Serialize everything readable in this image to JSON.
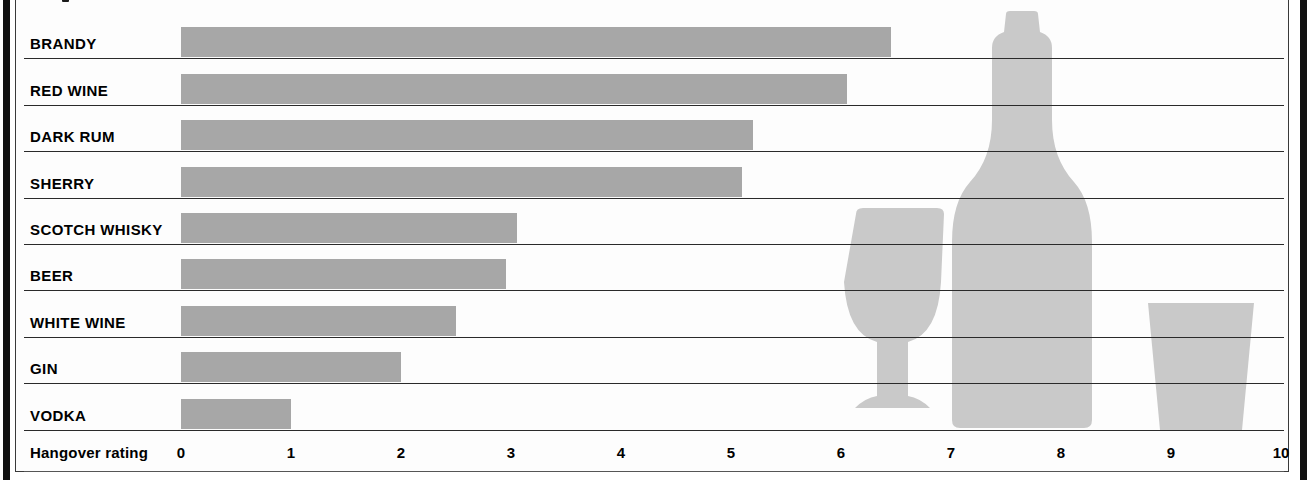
{
  "chart_data": {
    "type": "bar",
    "orientation": "horizontal",
    "title": "",
    "xlabel": "Hangover rating",
    "ylabel": "",
    "xlim": [
      0,
      10
    ],
    "xticks": [
      "0",
      "1",
      "2",
      "3",
      "4",
      "5",
      "6",
      "7",
      "8",
      "9",
      "10"
    ],
    "grid": false,
    "legend": "none",
    "categories": [
      "BRANDY",
      "RED WINE",
      "DARK RUM",
      "SHERRY",
      "SCOTCH WHISKY",
      "BEER",
      "WHITE WINE",
      "GIN",
      "VODKA"
    ],
    "values": [
      6.45,
      6.05,
      5.2,
      5.1,
      3.05,
      2.95,
      2.5,
      2.0,
      1.0
    ],
    "bars": [
      {
        "label": "BRANDY",
        "value": 6.45
      },
      {
        "label": "RED WINE",
        "value": 6.05
      },
      {
        "label": "DARK RUM",
        "value": 5.2
      },
      {
        "label": "SHERRY",
        "value": 5.1
      },
      {
        "label": "SCOTCH WHISKY",
        "value": 3.05
      },
      {
        "label": "BEER",
        "value": 2.95
      },
      {
        "label": "WHITE WINE",
        "value": 2.5
      },
      {
        "label": "GIN",
        "value": 2.0
      },
      {
        "label": "VODKA",
        "value": 1.0
      }
    ]
  },
  "colors": {
    "bar_fill": "#a7a7a7",
    "glassware_fill": "#c9c9c9",
    "rule_line": "#2a2a2a",
    "spine": "#111111",
    "page_background": "#fdfdfd",
    "text": "#000000"
  },
  "decorations": [
    {
      "name": "wine-glass-illustration"
    },
    {
      "name": "wine-bottle-illustration"
    },
    {
      "name": "tumbler-glass-illustration"
    }
  ]
}
